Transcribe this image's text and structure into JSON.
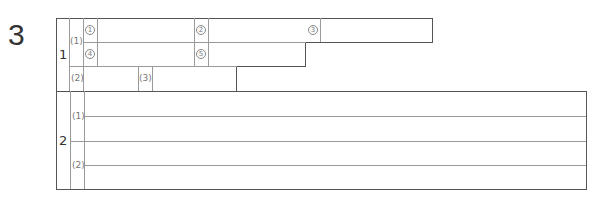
{
  "question_number": "3",
  "section1": {
    "number": "1",
    "part1": {
      "label": "(1)",
      "blanks": [
        "1",
        "2",
        "3",
        "4",
        "5"
      ]
    },
    "part2": {
      "label": "(2)"
    },
    "part3": {
      "label": "(3)"
    }
  },
  "section2": {
    "number": "2",
    "parts": [
      {
        "label": "(1)"
      },
      {
        "label": "(2)"
      }
    ]
  },
  "colors": {
    "border_dark": "#555555",
    "border_light": "#9a9a9a",
    "text": "#333333",
    "label_text": "#777777"
  }
}
